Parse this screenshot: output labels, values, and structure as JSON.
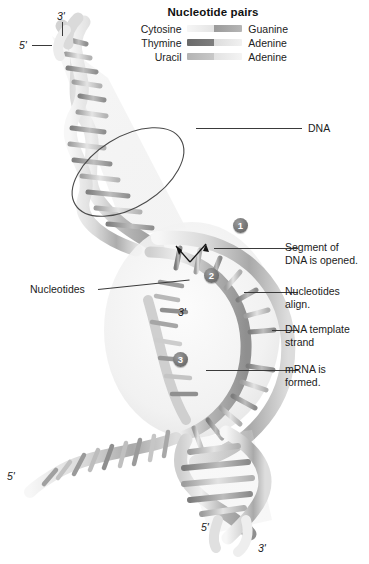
{
  "figure": {
    "background": "#ffffff"
  },
  "legend": {
    "title": "Nucleotide pairs",
    "rows": [
      {
        "left": "Cytosine",
        "right": "Guanine",
        "left_color": "#e9e9e9",
        "right_color": "#9a9a9a"
      },
      {
        "left": "Thymine",
        "right": "Adenine",
        "left_color": "#6f6f6f",
        "right_color": "#dedede"
      },
      {
        "left": "Uracil",
        "right": "Adenine",
        "left_color": "#bdbdbd",
        "right_color": "#e4e4e4"
      }
    ]
  },
  "callouts": [
    {
      "id": "dna",
      "text": "DNA"
    },
    {
      "id": "segment-opened",
      "text": "Segment of\nDNA is opened."
    },
    {
      "id": "nucleotides",
      "text": "Nucleotides"
    },
    {
      "id": "nucleotides-align",
      "text": "Nucleotides\nalign."
    },
    {
      "id": "dna-template",
      "text": "DNA template\nstrand"
    },
    {
      "id": "mrna-formed",
      "text": "mRNA is\nformed."
    }
  ],
  "steps": [
    {
      "number": "1"
    },
    {
      "number": "2"
    },
    {
      "number": "3"
    }
  ],
  "end_labels": [
    {
      "id": "top-3prime",
      "text": "3'"
    },
    {
      "id": "top-5prime",
      "text": "5'"
    },
    {
      "id": "middle-3prime",
      "text": "3'"
    },
    {
      "id": "left-5prime",
      "text": "5'"
    },
    {
      "id": "bottom-5prime",
      "text": "5'"
    },
    {
      "id": "bottom-3prime",
      "text": "3'"
    }
  ],
  "colors": {
    "strand_light": "#f2f2f2",
    "strand_mid": "#c9c9c9",
    "strand_dark": "#8e8e8e",
    "rung_dark": "#8a8a8a",
    "line": "#3a3a3a"
  }
}
